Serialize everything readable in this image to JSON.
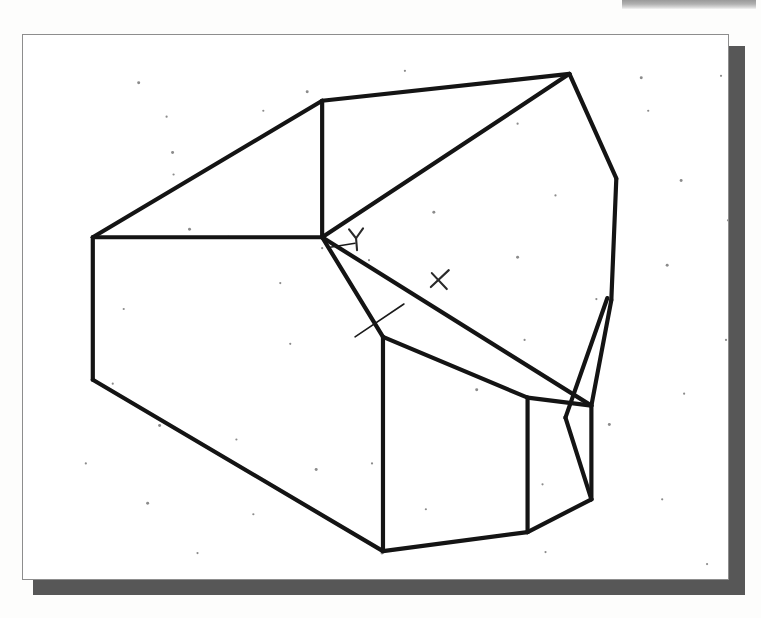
{
  "page": {
    "background_color": "#fdfdfc",
    "width": 761,
    "height": 618
  },
  "top_band": {
    "name": "scan-edge-band",
    "color": "#8f8f8f",
    "x": 622,
    "y": 0,
    "width": 134,
    "height": 9
  },
  "panel": {
    "name": "drawing-panel",
    "x": 22,
    "y": 34,
    "width": 707,
    "height": 546,
    "fill": "#ffffff",
    "border_color": "#8d8d8d",
    "shadow_color": "#575757",
    "shadow_offset_x": 11,
    "shadow_offset_y": 12
  },
  "drawing": {
    "name": "polyhedron-wireframe",
    "description": "Faceted solid shown as a 3D wireframe line drawing",
    "stroke_color": "#141414",
    "stroke_width": 4.2,
    "thin_stroke_width": 1.6,
    "vertices": {
      "top_peak": [
        570,
        73
      ],
      "upper_left_bend": [
        322,
        100
      ],
      "left_upper": [
        92,
        237
      ],
      "left_lower": [
        92,
        380
      ],
      "center_node": [
        322,
        237
      ],
      "bottom_left": [
        383,
        552
      ],
      "front_top": [
        383,
        337
      ],
      "front_right_top": [
        528,
        398
      ],
      "right_upper": [
        617,
        178
      ],
      "right_sliver_top": [
        612,
        298
      ],
      "right_node": [
        592,
        406
      ],
      "bottom_mid": [
        528,
        533
      ],
      "bottom_right": [
        592,
        500
      ],
      "mid_right_edge": [
        612,
        300
      ]
    },
    "edges": [
      {
        "name": "top-ridge-left",
        "from": [
          322,
          100
        ],
        "to": [
          570,
          73
        ]
      },
      {
        "name": "upper-left-slope",
        "from": [
          92,
          237
        ],
        "to": [
          322,
          100
        ]
      },
      {
        "name": "left-vertical",
        "from": [
          92,
          237
        ],
        "to": [
          92,
          380
        ]
      },
      {
        "name": "inner-vertical-upper",
        "from": [
          322,
          100
        ],
        "to": [
          322,
          237
        ]
      },
      {
        "name": "left-horizontal-to-node",
        "from": [
          92,
          237
        ],
        "to": [
          322,
          237
        ]
      },
      {
        "name": "long-diagonal-node-to-peak",
        "from": [
          322,
          237
        ],
        "to": [
          570,
          73
        ]
      },
      {
        "name": "lower-left-diagonal",
        "from": [
          92,
          380
        ],
        "to": [
          383,
          552
        ]
      },
      {
        "name": "node-to-front-top",
        "from": [
          322,
          237
        ],
        "to": [
          383,
          337
        ]
      },
      {
        "name": "front-left-vertical",
        "from": [
          383,
          337
        ],
        "to": [
          383,
          552
        ]
      },
      {
        "name": "front-top-to-right",
        "from": [
          383,
          337
        ],
        "to": [
          528,
          398
        ]
      },
      {
        "name": "front-right-vertical",
        "from": [
          528,
          398
        ],
        "to": [
          528,
          533
        ]
      },
      {
        "name": "bottom-front-edge",
        "from": [
          383,
          552
        ],
        "to": [
          528,
          533
        ]
      },
      {
        "name": "bottom-right-edge",
        "from": [
          528,
          533
        ],
        "to": [
          592,
          500
        ]
      },
      {
        "name": "right-lower-vertical",
        "from": [
          592,
          500
        ],
        "to": [
          592,
          406
        ]
      },
      {
        "name": "sliver-right-edge",
        "from": [
          592,
          406
        ],
        "to": [
          612,
          300
        ]
      },
      {
        "name": "sliver-left-edge",
        "from": [
          566,
          418
        ],
        "to": [
          608,
          298
        ]
      },
      {
        "name": "right-upper-slope",
        "from": [
          570,
          73
        ],
        "to": [
          617,
          178
        ]
      },
      {
        "name": "right-upper-to-sliver",
        "from": [
          617,
          178
        ],
        "to": [
          612,
          300
        ]
      },
      {
        "name": "node-to-right-long",
        "from": [
          322,
          237
        ],
        "to": [
          592,
          406
        ]
      },
      {
        "name": "front-right-to-right-node",
        "from": [
          528,
          398
        ],
        "to": [
          592,
          406
        ]
      },
      {
        "name": "right-node-down",
        "from": [
          566,
          418
        ],
        "to": [
          592,
          500
        ]
      }
    ],
    "thin_edges": [
      {
        "name": "construction-line-front-facet",
        "from": [
          355,
          337
        ],
        "to": [
          404,
          304
        ]
      },
      {
        "name": "construction-line-node-short",
        "from": [
          330,
          247
        ],
        "to": [
          355,
          243
        ]
      }
    ],
    "annotations": [
      {
        "name": "axis-label-y",
        "text": "Y",
        "x": 356,
        "y": 240
      },
      {
        "name": "axis-label-x",
        "text": "X",
        "x": 440,
        "y": 280
      }
    ]
  },
  "specks": [
    [
      116,
      48
    ],
    [
      144,
      82
    ],
    [
      241,
      76
    ],
    [
      285,
      57
    ],
    [
      383,
      36
    ],
    [
      496,
      89
    ],
    [
      620,
      43
    ],
    [
      700,
      41
    ],
    [
      151,
      140
    ],
    [
      206,
      203
    ],
    [
      258,
      249
    ],
    [
      300,
      214
    ],
    [
      167,
      195
    ],
    [
      101,
      275
    ],
    [
      347,
      226
    ],
    [
      496,
      223
    ],
    [
      574,
      98
    ],
    [
      627,
      76
    ],
    [
      660,
      146
    ],
    [
      707,
      186
    ],
    [
      90,
      350
    ],
    [
      137,
      392
    ],
    [
      214,
      406
    ],
    [
      350,
      430
    ],
    [
      455,
      356
    ],
    [
      503,
      306
    ],
    [
      575,
      265
    ],
    [
      646,
      231
    ],
    [
      705,
      306
    ],
    [
      63,
      430
    ],
    [
      125,
      470
    ],
    [
      175,
      520
    ],
    [
      231,
      481
    ],
    [
      294,
      436
    ],
    [
      404,
      476
    ],
    [
      521,
      451
    ],
    [
      588,
      391
    ],
    [
      641,
      466
    ],
    [
      712,
      400
    ],
    [
      99,
      548
    ],
    [
      180,
      572
    ],
    [
      298,
      564
    ],
    [
      360,
      520
    ],
    [
      441,
      563
    ],
    [
      524,
      519
    ],
    [
      608,
      556
    ],
    [
      686,
      531
    ],
    [
      268,
      310
    ],
    [
      412,
      178
    ],
    [
      534,
      161
    ],
    [
      663,
      360
    ],
    [
      150,
      118
    ]
  ]
}
